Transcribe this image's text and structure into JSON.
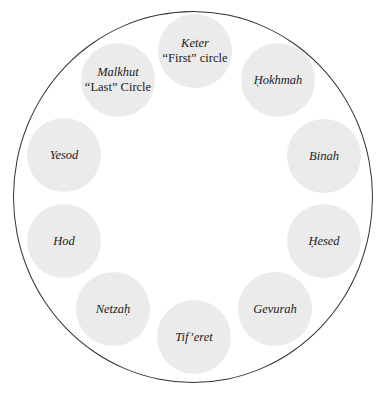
{
  "diagram": {
    "title": "",
    "outer_ring": {
      "cx": 193,
      "cy": 197,
      "rx": 180,
      "ry": 186,
      "stroke": "#333333"
    },
    "node_fill": "#ebebeb",
    "text_color": "#222222",
    "nodes": [
      {
        "id": "keter",
        "name": "Keter",
        "sub": "“First” circle",
        "x": 195,
        "y": 51
      },
      {
        "id": "hokhmah",
        "name": "Ḥokhmah",
        "sub": "",
        "x": 278,
        "y": 80
      },
      {
        "id": "binah",
        "name": "Binah",
        "sub": "",
        "x": 324,
        "y": 156
      },
      {
        "id": "hesed",
        "name": "Ḥesed",
        "sub": "",
        "x": 324,
        "y": 241
      },
      {
        "id": "gevurah",
        "name": "Gevurah",
        "sub": "",
        "x": 275,
        "y": 309
      },
      {
        "id": "tiferet",
        "name": "Tif’eret",
        "sub": "",
        "x": 194,
        "y": 337
      },
      {
        "id": "netzah",
        "name": "Netzaḥ",
        "sub": "",
        "x": 113,
        "y": 309
      },
      {
        "id": "hod",
        "name": "Hod",
        "sub": "",
        "x": 64,
        "y": 241
      },
      {
        "id": "yesod",
        "name": "Yesod",
        "sub": "",
        "x": 64,
        "y": 155
      },
      {
        "id": "malkhut",
        "name": "Malkhut",
        "sub": "“Last” Circle",
        "x": 118,
        "y": 80
      }
    ]
  }
}
